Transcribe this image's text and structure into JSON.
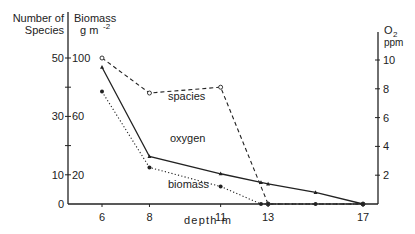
{
  "chart_data": {
    "type": "line",
    "title": "",
    "xlabel": "depth  m",
    "x": [
      6,
      8,
      11,
      13,
      15,
      17
    ],
    "x_ticks": [
      "6",
      "8",
      "11",
      "13",
      "17"
    ],
    "xlim": [
      5,
      17.5
    ],
    "y_axes": {
      "left_species": {
        "label_line1": "Number of",
        "label_line2": "Species",
        "ticks": [
          "0",
          "10",
          "30",
          "50"
        ],
        "ylim": [
          0,
          50
        ]
      },
      "left_biomass": {
        "label_line1": "Biomass",
        "label_line2": "g m",
        "label_sup": "-2",
        "ticks": [
          "20",
          "60",
          "100"
        ],
        "ylim": [
          0,
          100
        ]
      },
      "right_oxygen": {
        "label_line1": "O",
        "label_sub": "2",
        "label_line2": "ppm",
        "ticks": [
          "2",
          "4",
          "6",
          "8",
          "10"
        ],
        "ylim": [
          0,
          10
        ]
      }
    },
    "series": [
      {
        "name": "spacies",
        "axis": "left_species",
        "style": "dashed",
        "marker": "open-circle",
        "points": [
          [
            6,
            50
          ],
          [
            8,
            38
          ],
          [
            11,
            40
          ],
          [
            13,
            0
          ],
          [
            17,
            0
          ]
        ]
      },
      {
        "name": "oxygen",
        "axis": "right_oxygen",
        "style": "solid",
        "marker": "triangle",
        "points": [
          [
            6,
            9.5
          ],
          [
            8,
            3.3
          ],
          [
            11,
            2.1
          ],
          [
            12.7,
            1.5
          ],
          [
            13,
            1.4
          ],
          [
            15,
            0.8
          ],
          [
            17,
            0
          ]
        ]
      },
      {
        "name": "biomass",
        "axis": "left_biomass",
        "style": "dotted",
        "marker": "filled-dot",
        "points": [
          [
            6,
            77
          ],
          [
            8,
            25
          ],
          [
            11,
            12
          ],
          [
            12.7,
            0
          ],
          [
            13,
            0
          ],
          [
            15,
            0
          ],
          [
            17,
            0
          ]
        ]
      }
    ],
    "annotations": [
      {
        "text": "spacies",
        "x": 9.1,
        "y_species": 42
      },
      {
        "text": "oxygen",
        "x": 9.1,
        "y_species": 30
      },
      {
        "text": "biomass",
        "x": 8.9,
        "y_species": 9
      }
    ],
    "grid": false,
    "legend": "inline labels"
  }
}
